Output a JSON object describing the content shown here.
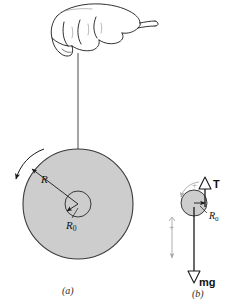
{
  "figure": {
    "background_color": "#ffffff",
    "ink_color": "#1a1a1a",
    "disc_fill_color": "#cdcdcd",
    "disc_stroke_color": "#3a3a3a",
    "sign_convention_color": "#9b9b9b"
  },
  "panel_a": {
    "caption": "(a)",
    "labels": {
      "radius_outer": "R",
      "radius_inner_main": "R",
      "radius_inner_sub": "0"
    },
    "elements": {
      "hand": "hand-holding-string",
      "string": "string-line",
      "disc_outer": "outer-disc",
      "disc_inner": "inner-hub",
      "rotation_arrow": "counterclockwise-rotation-arrow"
    }
  },
  "panel_b": {
    "caption": "(b)",
    "labels": {
      "tension_main": "T",
      "weight_main": "mg",
      "radius_inner_main": "R",
      "radius_inner_sub": "0",
      "positive_rotation": "+",
      "positive_translation": "+"
    },
    "elements": {
      "disc": "free-body-disc",
      "tension_arrow": "tension-arrow-up",
      "weight_arrow": "weight-arrow-down",
      "rotation_sign_arrow": "positive-rotation-sense-arrow",
      "translation_sign_arrow": "positive-translation-sense-arrow"
    }
  }
}
